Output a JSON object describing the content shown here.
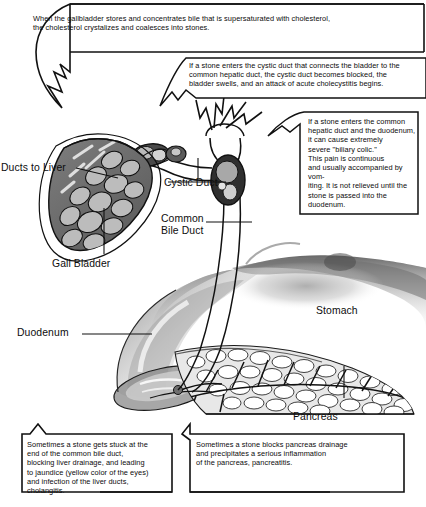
{
  "diagram": {
    "ink_color": "#111111",
    "paper_color": "#ffffff"
  },
  "callouts": [
    {
      "id": "cholesterol-stones",
      "text": "When the gallbladder stores and concentrates bile that is supersaturated with cholesterol,\nthe cholesterol crystalizes and coalesces into stones."
    },
    {
      "id": "cystic-duct-blockage",
      "text": "If a stone enters the cystic duct that connects the bladder to the\ncommon hepatic duct, the cystic duct becomes blocked, the\nbladder swells, and an attack of acute cholecystitis begins."
    },
    {
      "id": "biliary-colic",
      "text": "If a stone enters the common\nhepatic duct and the duodenum,\nit can cause extremely\nsevere \"biliary colic.\"\nThis pain is continuous\nand usually accompanied by vom-\niting. It is not relieved until the\nstone is passed into the\nduodenum."
    },
    {
      "id": "cholangitis",
      "text": "Sometimes a stone gets stuck at the\nend of the common bile duct,\nblocking liver drainage, and leading\nto jaundice (yellow color of the eyes)\nand infection of the liver ducts,\ncholangitis."
    },
    {
      "id": "pancreatitis",
      "text": "Sometimes a stone  blocks pancreas drainage\nand precipitates a serious inflammation\nof the pancreas, pancreatitis."
    }
  ],
  "labels": {
    "ducts_to_liver": "Ducts to Liver",
    "gall_bladder": "Gall Bladder",
    "cystic_duct": "Cystic Duct",
    "common_bile_duct": "Common\nBile Duct",
    "duodenum": "Duodenum",
    "stomach": "Stomach",
    "pancreas": "Pancreas"
  }
}
